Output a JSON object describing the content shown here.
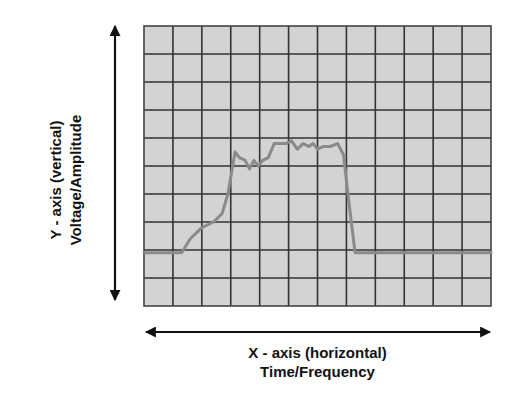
{
  "y_axis": {
    "line1": "Y - axis (vertical)",
    "line2": "Voltage/Amplitude"
  },
  "x_axis": {
    "line1": "X - axis (horizontal)",
    "line2": "Time/Frequency"
  },
  "colors": {
    "grid_background": "#d3d3d3",
    "grid_lines": "#333333",
    "waveform": "#8a8a8a",
    "arrows": "#111111"
  },
  "chart_data": {
    "type": "line",
    "title": "",
    "xlabel": "X - axis (horizontal) Time/Frequency",
    "ylabel": "Y - axis (vertical) Voltage/Amplitude",
    "grid": true,
    "grid_divisions": {
      "x": 12,
      "y": 10
    },
    "xlim": [
      0,
      12
    ],
    "ylim": [
      0,
      10
    ],
    "series": [
      {
        "name": "waveform",
        "x": [
          0,
          1.3,
          1.6,
          2.0,
          2.4,
          2.7,
          2.9,
          3.05,
          3.15,
          3.3,
          3.5,
          3.65,
          3.8,
          3.95,
          4.1,
          4.3,
          4.5,
          4.9,
          5.1,
          5.3,
          5.5,
          5.7,
          5.85,
          6.0,
          6.2,
          6.45,
          6.7,
          6.9,
          7.05,
          7.3,
          7.6,
          9.0,
          12
        ],
        "y": [
          1.9,
          1.9,
          2.4,
          2.8,
          3.0,
          3.3,
          4.0,
          4.9,
          5.5,
          5.3,
          5.2,
          4.9,
          5.2,
          5.0,
          5.2,
          5.3,
          5.8,
          5.8,
          5.9,
          5.6,
          5.8,
          5.7,
          5.8,
          5.6,
          5.7,
          5.7,
          5.8,
          5.4,
          4.0,
          1.9,
          1.9,
          1.9,
          1.9
        ]
      }
    ]
  }
}
